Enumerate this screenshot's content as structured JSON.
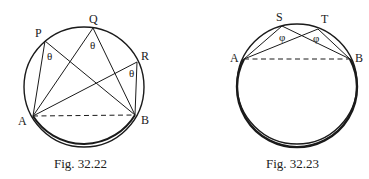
{
  "figures": [
    {
      "id": "fig1",
      "caption": "Fig. 32.22",
      "points": {
        "P": "P",
        "Q": "Q",
        "R": "R",
        "A": "A",
        "B": "B"
      },
      "angle_symbol": "θ",
      "description": "Angles subtended by chord AB at points P, Q, R on the major arc are equal (θ)"
    },
    {
      "id": "fig2",
      "caption": "Fig. 32.23",
      "points": {
        "S": "S",
        "T": "T",
        "A": "A",
        "B": "B"
      },
      "angle_symbol": "φ",
      "description": "Angles subtended by chord AB at points S, T on the minor arc are equal (φ)"
    }
  ],
  "colors": {
    "stroke": "#1a1a1a",
    "background": "#ffffff"
  }
}
